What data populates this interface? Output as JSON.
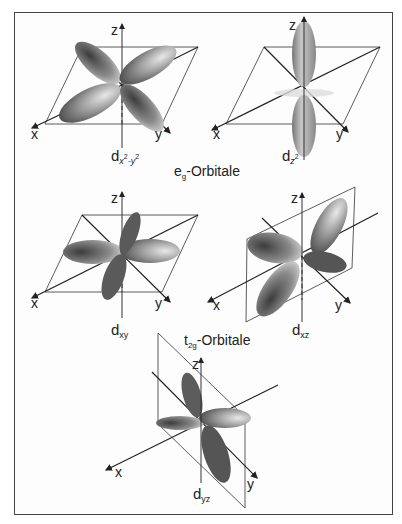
{
  "figure": {
    "frame_color": "#444444",
    "lobe_dark": "#4a4a4a",
    "lobe_light": "#e8e8e8"
  },
  "groups": [
    {
      "name": "eg",
      "main": "e",
      "sub": "g",
      "suffix": "-Orbitale",
      "orbitals": [
        {
          "symbol": "d",
          "sub": "x²-y²",
          "sub_base": "x",
          "sub_sup1": "2",
          "sub_mid": "-y",
          "sub_sup2": "2",
          "plane": "xy"
        },
        {
          "symbol": "d",
          "sub": "z²",
          "sub_base": "z",
          "sub_sup1": "2",
          "plane": "xy"
        }
      ]
    },
    {
      "name": "t2g",
      "main": "t",
      "sub": "2g",
      "suffix": "-Orbitale",
      "orbitals": [
        {
          "symbol": "d",
          "sub": "xy",
          "plane": "xy"
        },
        {
          "symbol": "d",
          "sub": "xz",
          "plane": "xz"
        },
        {
          "symbol": "d",
          "sub": "yz",
          "plane": "yz"
        }
      ]
    }
  ],
  "axes": {
    "x": "x",
    "y": "y",
    "z": "z"
  }
}
